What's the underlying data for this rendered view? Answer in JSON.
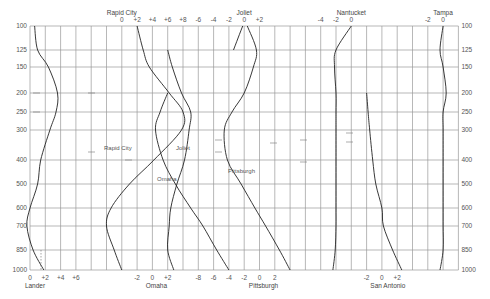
{
  "chart_data": {
    "type": "line",
    "title": "",
    "xlabel": "",
    "ylabel": "Pressure (mb)",
    "y_axis": {
      "scale": "log-pressure",
      "ticks": [
        100,
        125,
        150,
        200,
        250,
        300,
        400,
        500,
        600,
        700,
        850,
        1000
      ],
      "ylim": [
        1000,
        100
      ],
      "left_labels": [
        "100",
        "125",
        "150",
        "200",
        "250",
        "300",
        "400",
        "500",
        "600",
        "700",
        "850",
        "1000"
      ],
      "right_labels": [
        "100",
        "125",
        "150",
        "200",
        "250",
        "300",
        "400",
        "500",
        "600",
        "700",
        "850",
        "1000"
      ]
    },
    "grid": true,
    "top_axes": [
      {
        "station": "Rapid City",
        "ticks": [
          "0",
          "+2",
          "+4",
          "+6",
          "+8"
        ]
      },
      {
        "station": "Joliet",
        "ticks": [
          "-6",
          "-4",
          "-2",
          "0",
          "+2"
        ]
      },
      {
        "station": "Nantucket",
        "ticks": [
          "-4",
          "-2",
          "0"
        ]
      },
      {
        "station": "Tampa",
        "ticks": [
          "-2",
          "0"
        ]
      }
    ],
    "bottom_axes": [
      {
        "station": "Lander",
        "ticks": [
          "0",
          "+2",
          "+4",
          "+6"
        ]
      },
      {
        "station": "Omaha",
        "ticks": [
          "-2",
          "0",
          "+2"
        ]
      },
      {
        "station": "Pittsburgh",
        "ticks": [
          "-8",
          "-6",
          "-4",
          "-2",
          "0",
          "2"
        ]
      },
      {
        "station": "San Antonio",
        "ticks": [
          "-2",
          "0",
          "+2"
        ]
      }
    ],
    "annotations": [
      "Rapid City",
      "Joliet",
      "Omaha",
      "Pittsburgh"
    ],
    "series": [
      {
        "name": "Lander",
        "pressure": [
          100,
          125,
          150,
          200,
          250,
          300,
          400,
          500,
          600,
          700,
          850,
          1000
        ],
        "values": [
          0.6,
          1.0,
          2.4,
          3.6,
          3.4,
          2.6,
          1.4,
          1.0,
          0.0,
          -0.4,
          0.4,
          1.8
        ]
      },
      {
        "name": "Rapid City",
        "pressure": [
          100,
          125,
          150,
          200,
          250,
          300,
          400,
          500,
          600,
          700,
          850,
          1000
        ],
        "values": [
          2.0,
          2.8,
          3.6,
          6.2,
          8.0,
          7.8,
          4.2,
          1.0,
          -1.4,
          -2.0,
          -1.0,
          0.0
        ]
      },
      {
        "name": "Omaha",
        "pressure": [
          125,
          150,
          200,
          250,
          300,
          400,
          500,
          600,
          700,
          850,
          1000
        ],
        "values": [
          -9.0,
          -8.4,
          -7.2,
          -6.0,
          -6.2,
          -6.8,
          -7.8,
          -8.6,
          -8.8,
          -9.0,
          -8.2
        ]
      },
      {
        "name": "Joliet",
        "pressure": [
          200,
          250,
          300,
          400,
          500,
          600,
          700,
          850,
          1000
        ],
        "values": [
          -5.0,
          -6.0,
          -6.6,
          -5.6,
          -4.0,
          -2.0,
          -0.4,
          1.4,
          3.0
        ]
      },
      {
        "name": "Pittsburgh",
        "pressure": [
          100,
          125,
          150,
          200,
          250,
          300,
          400,
          500,
          600,
          700,
          850,
          1000
        ],
        "values": [
          0.4,
          1.6,
          1.2,
          0.0,
          -1.6,
          -2.6,
          -2.2,
          -0.4,
          1.4,
          2.8,
          4.6,
          6.0
        ]
      },
      {
        "name": "Joliet (upper)",
        "pressure": [
          100,
          125
        ],
        "values": [
          1.8,
          0.6
        ]
      },
      {
        "name": "Nantucket",
        "pressure": [
          100,
          125,
          150,
          200,
          250,
          300,
          400,
          500,
          600,
          700,
          850,
          1000
        ],
        "values": [
          0.0,
          -2.0,
          -2.2,
          -2.0,
          -2.0,
          -2.0,
          -2.0,
          -2.0,
          -2.0,
          -2.0,
          -2.1,
          -2.4
        ]
      },
      {
        "name": "San Antonio",
        "pressure": [
          200,
          250,
          300,
          400,
          500,
          600,
          700,
          850,
          1000
        ],
        "values": [
          -2.0,
          -1.8,
          -1.6,
          -1.2,
          -0.8,
          0.0,
          0.2,
          1.4,
          2.6
        ]
      },
      {
        "name": "Tampa",
        "pressure": [
          100,
          125,
          150,
          200,
          250,
          300,
          400,
          500,
          600,
          700,
          850,
          1000
        ],
        "values": [
          0.0,
          -0.4,
          0.0,
          0.4,
          0.0,
          0.0,
          0.0,
          0.0,
          0.0,
          0.0,
          0.0,
          -0.4
        ]
      }
    ]
  }
}
